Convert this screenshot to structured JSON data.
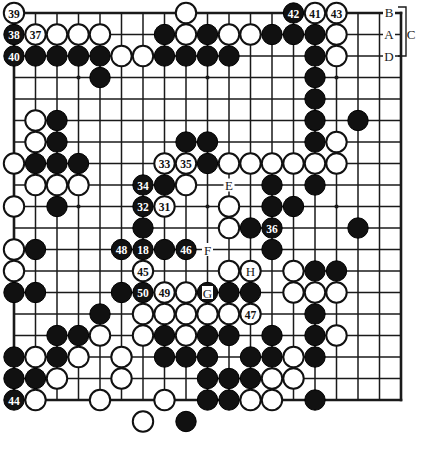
{
  "diagram": {
    "type": "go-board-position",
    "board_size": 19,
    "colors": {
      "black_stone": "#111111",
      "white_stone": "#ffffff",
      "line": "#1a1a1a",
      "background": "#ffffff",
      "black_label_text": "#ffffff",
      "white_label_text": "#111111"
    },
    "geometry": {
      "origin_x": 14,
      "origin_y": 13,
      "spacing": 21.5,
      "stone_radius": 10.2
    },
    "hoshi": [
      {
        "col": 3,
        "row": 3
      },
      {
        "col": 9,
        "row": 3
      },
      {
        "col": 15,
        "row": 3
      },
      {
        "col": 3,
        "row": 9
      },
      {
        "col": 9,
        "row": 9
      },
      {
        "col": 15,
        "row": 9
      },
      {
        "col": 3,
        "row": 15
      },
      {
        "col": 9,
        "row": 15
      },
      {
        "col": 15,
        "row": 15
      }
    ],
    "stones": [
      {
        "col": 1,
        "row": 1,
        "color": "white",
        "label": "39"
      },
      {
        "col": 9,
        "row": 1,
        "color": "white",
        "label": ""
      },
      {
        "col": 14,
        "row": 1,
        "color": "black",
        "label": "42"
      },
      {
        "col": 15,
        "row": 1,
        "color": "white",
        "label": "41"
      },
      {
        "col": 16,
        "row": 1,
        "color": "white",
        "label": "43"
      },
      {
        "col": 1,
        "row": 2,
        "color": "black",
        "label": "38"
      },
      {
        "col": 2,
        "row": 2,
        "color": "white",
        "label": "37"
      },
      {
        "col": 3,
        "row": 2,
        "color": "white",
        "label": ""
      },
      {
        "col": 4,
        "row": 2,
        "color": "white",
        "label": ""
      },
      {
        "col": 5,
        "row": 2,
        "color": "white",
        "label": ""
      },
      {
        "col": 8,
        "row": 2,
        "color": "black",
        "label": ""
      },
      {
        "col": 9,
        "row": 2,
        "color": "white",
        "label": ""
      },
      {
        "col": 10,
        "row": 2,
        "color": "black",
        "label": ""
      },
      {
        "col": 11,
        "row": 2,
        "color": "white",
        "label": ""
      },
      {
        "col": 12,
        "row": 2,
        "color": "white",
        "label": ""
      },
      {
        "col": 13,
        "row": 2,
        "color": "black",
        "label": ""
      },
      {
        "col": 14,
        "row": 2,
        "color": "black",
        "label": ""
      },
      {
        "col": 15,
        "row": 2,
        "color": "black",
        "label": ""
      },
      {
        "col": 16,
        "row": 2,
        "color": "white",
        "label": ""
      },
      {
        "col": 1,
        "row": 3,
        "color": "black",
        "label": "40"
      },
      {
        "col": 2,
        "row": 3,
        "color": "black",
        "label": ""
      },
      {
        "col": 3,
        "row": 3,
        "color": "black",
        "label": ""
      },
      {
        "col": 4,
        "row": 3,
        "color": "black",
        "label": ""
      },
      {
        "col": 5,
        "row": 3,
        "color": "black",
        "label": ""
      },
      {
        "col": 6,
        "row": 3,
        "color": "white",
        "label": ""
      },
      {
        "col": 7,
        "row": 3,
        "color": "white",
        "label": ""
      },
      {
        "col": 8,
        "row": 3,
        "color": "black",
        "label": ""
      },
      {
        "col": 9,
        "row": 3,
        "color": "black",
        "label": ""
      },
      {
        "col": 10,
        "row": 3,
        "color": "black",
        "label": ""
      },
      {
        "col": 11,
        "row": 3,
        "color": "black",
        "label": ""
      },
      {
        "col": 15,
        "row": 3,
        "color": "black",
        "label": ""
      },
      {
        "col": 16,
        "row": 3,
        "color": "white",
        "label": ""
      },
      {
        "col": 5,
        "row": 4,
        "color": "black",
        "label": ""
      },
      {
        "col": 15,
        "row": 4,
        "color": "black",
        "label": ""
      },
      {
        "col": 15,
        "row": 5,
        "color": "black",
        "label": ""
      },
      {
        "col": 2,
        "row": 6,
        "color": "white",
        "label": ""
      },
      {
        "col": 3,
        "row": 6,
        "color": "black",
        "label": ""
      },
      {
        "col": 15,
        "row": 6,
        "color": "black",
        "label": ""
      },
      {
        "col": 17,
        "row": 6,
        "color": "black",
        "label": ""
      },
      {
        "col": 2,
        "row": 7,
        "color": "white",
        "label": ""
      },
      {
        "col": 3,
        "row": 7,
        "color": "black",
        "label": ""
      },
      {
        "col": 9,
        "row": 7,
        "color": "black",
        "label": ""
      },
      {
        "col": 10,
        "row": 7,
        "color": "black",
        "label": ""
      },
      {
        "col": 15,
        "row": 7,
        "color": "black",
        "label": ""
      },
      {
        "col": 16,
        "row": 7,
        "color": "white",
        "label": ""
      },
      {
        "col": 1,
        "row": 8,
        "color": "white",
        "label": ""
      },
      {
        "col": 2,
        "row": 8,
        "color": "black",
        "label": ""
      },
      {
        "col": 3,
        "row": 8,
        "color": "black",
        "label": ""
      },
      {
        "col": 4,
        "row": 8,
        "color": "black",
        "label": ""
      },
      {
        "col": 8,
        "row": 8,
        "color": "white",
        "label": "33"
      },
      {
        "col": 9,
        "row": 8,
        "color": "white",
        "label": "35"
      },
      {
        "col": 10,
        "row": 8,
        "color": "black",
        "label": ""
      },
      {
        "col": 11,
        "row": 8,
        "color": "white",
        "label": ""
      },
      {
        "col": 12,
        "row": 8,
        "color": "white",
        "label": ""
      },
      {
        "col": 13,
        "row": 8,
        "color": "white",
        "label": ""
      },
      {
        "col": 14,
        "row": 8,
        "color": "white",
        "label": ""
      },
      {
        "col": 15,
        "row": 8,
        "color": "white",
        "label": ""
      },
      {
        "col": 16,
        "row": 8,
        "color": "white",
        "label": ""
      },
      {
        "col": 2,
        "row": 9,
        "color": "white",
        "label": ""
      },
      {
        "col": 3,
        "row": 9,
        "color": "white",
        "label": ""
      },
      {
        "col": 4,
        "row": 9,
        "color": "white",
        "label": ""
      },
      {
        "col": 7,
        "row": 9,
        "color": "black",
        "label": "34"
      },
      {
        "col": 8,
        "row": 9,
        "color": "black",
        "label": ""
      },
      {
        "col": 9,
        "row": 9,
        "color": "white",
        "label": ""
      },
      {
        "col": 13,
        "row": 9,
        "color": "black",
        "label": ""
      },
      {
        "col": 15,
        "row": 9,
        "color": "black",
        "label": ""
      },
      {
        "col": 1,
        "row": 10,
        "color": "white",
        "label": ""
      },
      {
        "col": 3,
        "row": 10,
        "color": "black",
        "label": ""
      },
      {
        "col": 7,
        "row": 10,
        "color": "black",
        "label": "32"
      },
      {
        "col": 8,
        "row": 10,
        "color": "white",
        "label": "31"
      },
      {
        "col": 11,
        "row": 10,
        "color": "white",
        "label": ""
      },
      {
        "col": 13,
        "row": 10,
        "color": "black",
        "label": ""
      },
      {
        "col": 14,
        "row": 10,
        "color": "black",
        "label": ""
      },
      {
        "col": 7,
        "row": 11,
        "color": "black",
        "label": ""
      },
      {
        "col": 11,
        "row": 11,
        "color": "white",
        "label": ""
      },
      {
        "col": 12,
        "row": 11,
        "color": "black",
        "label": ""
      },
      {
        "col": 13,
        "row": 11,
        "color": "black",
        "label": ""
      },
      {
        "col": 17,
        "row": 11,
        "color": "black",
        "label": ""
      },
      {
        "col": 1,
        "row": 12,
        "color": "white",
        "label": ""
      },
      {
        "col": 2,
        "row": 12,
        "color": "black",
        "label": ""
      },
      {
        "col": 7,
        "row": 12,
        "color": "black",
        "label": "18"
      },
      {
        "col": 8,
        "row": 12,
        "color": "black",
        "label": ""
      },
      {
        "col": 9,
        "row": 12,
        "color": "black",
        "label": "46"
      },
      {
        "col": 13,
        "row": 12,
        "color": "black",
        "label": ""
      },
      {
        "col": 1,
        "row": 13,
        "color": "white",
        "label": ""
      },
      {
        "col": 7,
        "row": 13,
        "color": "white",
        "label": "45"
      },
      {
        "col": 11,
        "row": 13,
        "color": "white",
        "label": ""
      },
      {
        "col": 12,
        "row": 13,
        "color": "white",
        "label": ""
      },
      {
        "col": 14,
        "row": 13,
        "color": "white",
        "label": ""
      },
      {
        "col": 15,
        "row": 13,
        "color": "black",
        "label": ""
      },
      {
        "col": 16,
        "row": 13,
        "color": "black",
        "label": ""
      },
      {
        "col": 1,
        "row": 14,
        "color": "black",
        "label": ""
      },
      {
        "col": 2,
        "row": 14,
        "color": "black",
        "label": ""
      },
      {
        "col": 6,
        "row": 14,
        "color": "black",
        "label": ""
      },
      {
        "col": 7,
        "row": 14,
        "color": "black",
        "label": "50"
      },
      {
        "col": 8,
        "row": 14,
        "color": "white",
        "label": "49"
      },
      {
        "col": 9,
        "row": 14,
        "color": "white",
        "label": ""
      },
      {
        "col": 10,
        "row": 14,
        "color": "black",
        "label": ""
      },
      {
        "col": 11,
        "row": 14,
        "color": "black",
        "label": ""
      },
      {
        "col": 12,
        "row": 14,
        "color": "black",
        "label": ""
      },
      {
        "col": 14,
        "row": 14,
        "color": "white",
        "label": ""
      },
      {
        "col": 15,
        "row": 14,
        "color": "white",
        "label": ""
      },
      {
        "col": 16,
        "row": 14,
        "color": "white",
        "label": ""
      },
      {
        "col": 5,
        "row": 15,
        "color": "black",
        "label": ""
      },
      {
        "col": 7,
        "row": 15,
        "color": "white",
        "label": ""
      },
      {
        "col": 8,
        "row": 15,
        "color": "white",
        "label": ""
      },
      {
        "col": 9,
        "row": 15,
        "color": "white",
        "label": ""
      },
      {
        "col": 10,
        "row": 15,
        "color": "white",
        "label": ""
      },
      {
        "col": 11,
        "row": 15,
        "color": "white",
        "label": ""
      },
      {
        "col": 12,
        "row": 15,
        "color": "white",
        "label": "47"
      },
      {
        "col": 15,
        "row": 15,
        "color": "black",
        "label": ""
      },
      {
        "col": 3,
        "row": 16,
        "color": "black",
        "label": ""
      },
      {
        "col": 4,
        "row": 16,
        "color": "black",
        "label": ""
      },
      {
        "col": 5,
        "row": 16,
        "color": "white",
        "label": ""
      },
      {
        "col": 7,
        "row": 16,
        "color": "white",
        "label": ""
      },
      {
        "col": 8,
        "row": 16,
        "color": "black",
        "label": ""
      },
      {
        "col": 9,
        "row": 16,
        "color": "white",
        "label": ""
      },
      {
        "col": 10,
        "row": 16,
        "color": "black",
        "label": ""
      },
      {
        "col": 11,
        "row": 16,
        "color": "black",
        "label": ""
      },
      {
        "col": 13,
        "row": 16,
        "color": "black",
        "label": ""
      },
      {
        "col": 15,
        "row": 16,
        "color": "black",
        "label": ""
      },
      {
        "col": 16,
        "row": 16,
        "color": "white",
        "label": ""
      },
      {
        "col": 1,
        "row": 17,
        "color": "black",
        "label": ""
      },
      {
        "col": 2,
        "row": 17,
        "color": "white",
        "label": ""
      },
      {
        "col": 3,
        "row": 17,
        "color": "black",
        "label": ""
      },
      {
        "col": 4,
        "row": 17,
        "color": "white",
        "label": ""
      },
      {
        "col": 6,
        "row": 17,
        "color": "white",
        "label": ""
      },
      {
        "col": 8,
        "row": 17,
        "color": "black",
        "label": ""
      },
      {
        "col": 9,
        "row": 17,
        "color": "black",
        "label": ""
      },
      {
        "col": 10,
        "row": 17,
        "color": "black",
        "label": ""
      },
      {
        "col": 12,
        "row": 17,
        "color": "black",
        "label": ""
      },
      {
        "col": 13,
        "row": 17,
        "color": "black",
        "label": ""
      },
      {
        "col": 14,
        "row": 17,
        "color": "white",
        "label": ""
      },
      {
        "col": 15,
        "row": 17,
        "color": "black",
        "label": ""
      },
      {
        "col": 1,
        "row": 18,
        "color": "black",
        "label": ""
      },
      {
        "col": 2,
        "row": 18,
        "color": "black",
        "label": ""
      },
      {
        "col": 3,
        "row": 18,
        "color": "white",
        "label": ""
      },
      {
        "col": 6,
        "row": 18,
        "color": "white",
        "label": ""
      },
      {
        "col": 10,
        "row": 18,
        "color": "black",
        "label": ""
      },
      {
        "col": 11,
        "row": 18,
        "color": "black",
        "label": ""
      },
      {
        "col": 12,
        "row": 18,
        "color": "black",
        "label": ""
      },
      {
        "col": 13,
        "row": 18,
        "color": "white",
        "label": ""
      },
      {
        "col": 14,
        "row": 18,
        "color": "white",
        "label": ""
      },
      {
        "col": 1,
        "row": 19,
        "color": "black",
        "label": "44"
      },
      {
        "col": 2,
        "row": 19,
        "color": "white",
        "label": ""
      },
      {
        "col": 5,
        "row": 19,
        "color": "white",
        "label": ""
      },
      {
        "col": 8,
        "row": 19,
        "color": "white",
        "label": ""
      },
      {
        "col": 10,
        "row": 19,
        "color": "black",
        "label": ""
      },
      {
        "col": 11,
        "row": 19,
        "color": "black",
        "label": ""
      },
      {
        "col": 12,
        "row": 19,
        "color": "white",
        "label": ""
      },
      {
        "col": 13,
        "row": 19,
        "color": "white",
        "label": ""
      },
      {
        "col": 15,
        "row": 19,
        "color": "black",
        "label": ""
      },
      {
        "col": 7,
        "row": 20,
        "color": "white",
        "label": ""
      },
      {
        "col": 9,
        "row": 20,
        "color": "black",
        "label": ""
      }
    ],
    "point_letters": [
      {
        "col": 11,
        "row": 9,
        "text": "E"
      },
      {
        "col": 10,
        "row": 12,
        "text": "F"
      },
      {
        "col": 10,
        "row": 14,
        "text": "G"
      },
      {
        "col": 12,
        "row": 13,
        "text": "H"
      }
    ],
    "side_letters": [
      {
        "text": "B",
        "x": 389,
        "y": 12
      },
      {
        "text": "A",
        "x": 389,
        "y": 34
      },
      {
        "text": "C",
        "x": 411,
        "y": 34
      },
      {
        "text": "D",
        "x": 389,
        "y": 56
      }
    ],
    "move_numbers": [
      "18",
      "31",
      "32",
      "33",
      "34",
      "35",
      "36",
      "37",
      "38",
      "39",
      "40",
      "41",
      "42",
      "43",
      "44",
      "45",
      "46",
      "47",
      "48",
      "49",
      "50"
    ],
    "extra_labeled_stones": [
      {
        "col": 13,
        "row": 11,
        "color": "black",
        "label": "36"
      },
      {
        "col": 6,
        "row": 12,
        "color": "black",
        "label": "48"
      }
    ]
  }
}
